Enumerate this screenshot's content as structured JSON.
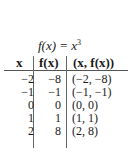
{
  "title": {
    "func": "f(x) = x",
    "exponent": "3"
  },
  "table": {
    "headers": [
      "x",
      "f(x)",
      "(x, f(x))"
    ],
    "rows": [
      [
        "−2",
        "−8",
        "(−2, −8)"
      ],
      [
        "−1",
        "−1",
        "(−1, −1)"
      ],
      [
        "0",
        "0",
        "(0, 0)"
      ],
      [
        "1",
        "1",
        "(1, 1)"
      ],
      [
        "2",
        "8",
        "(2, 8)"
      ]
    ]
  }
}
